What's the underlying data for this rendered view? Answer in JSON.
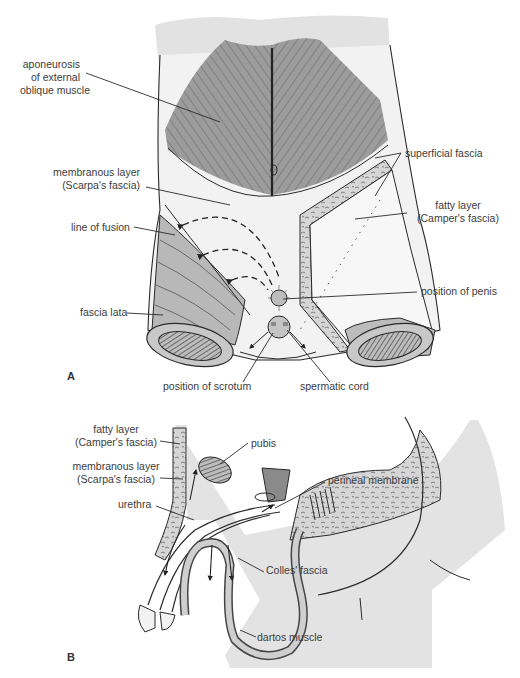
{
  "figure": {
    "panel_a": {
      "letter": "A",
      "labels": {
        "aponeurosis_1": "aponeurosis",
        "aponeurosis_2": "of external",
        "aponeurosis_3": "oblique muscle",
        "membranous_1": "membranous layer",
        "membranous_2": "(Scarpa's fascia)",
        "line_of_fusion": "line of fusion",
        "fascia_lata": "fascia lata",
        "superficial_fascia": "superficial fascia",
        "fatty_1": "fatty layer",
        "fatty_2": "(Camper's fascia)",
        "position_of_penis": "position of penis",
        "position_of_scrotum": "position of scrotum",
        "spermatic_cord": "spermatic cord"
      }
    },
    "panel_b": {
      "letter": "B",
      "labels": {
        "fatty_1": "fatty layer",
        "fatty_2": "(Camper's fascia)",
        "membranous_1": "membranous layer",
        "membranous_2": "(Scarpa's fascia)",
        "pubis": "pubis",
        "urethra": "urethra",
        "perineal_membrane": "perineal membrane",
        "colles_fascia": "Colles' fascia",
        "dartos_muscle": "dartos muscle"
      }
    },
    "colors": {
      "skin": "#e4e4e4",
      "muscle": "#9a9a9a",
      "fascia": "#f1f1f1",
      "line": "#2a2a2a"
    }
  }
}
